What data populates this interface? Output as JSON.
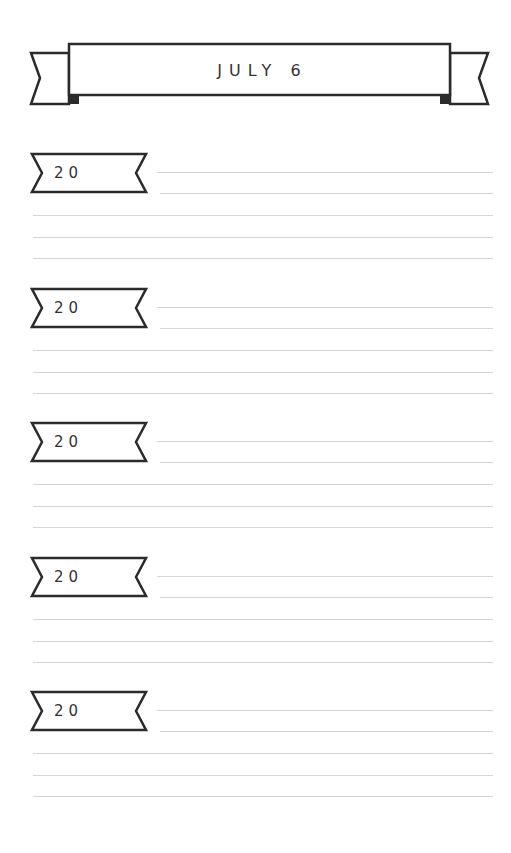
{
  "header": {
    "title": "JULY 6"
  },
  "entries": [
    {
      "year_prefix": "20",
      "lines": [
        "",
        "",
        "",
        "",
        ""
      ]
    },
    {
      "year_prefix": "20",
      "lines": [
        "",
        "",
        "",
        "",
        ""
      ]
    },
    {
      "year_prefix": "20",
      "lines": [
        "",
        "",
        "",
        "",
        ""
      ]
    },
    {
      "year_prefix": "20",
      "lines": [
        "",
        "",
        "",
        "",
        ""
      ]
    },
    {
      "year_prefix": "20",
      "lines": [
        "",
        "",
        "",
        "",
        ""
      ]
    }
  ],
  "colors": {
    "ink": "#2b2b2b",
    "rule": "#d6d6d6",
    "paper": "#ffffff"
  }
}
